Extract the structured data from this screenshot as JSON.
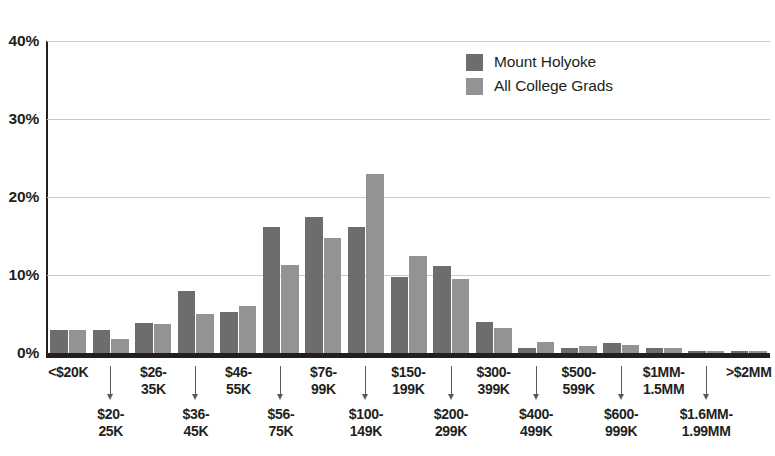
{
  "chart_data": {
    "type": "bar",
    "title": "",
    "subtitle": "",
    "xlabel": "",
    "ylabel": "",
    "ylim": [
      0,
      40
    ],
    "yticks": [
      0,
      10,
      20,
      30,
      40
    ],
    "ytick_labels": [
      "0%",
      "10%",
      "20%",
      "30%",
      "40%"
    ],
    "grid": true,
    "legend_position": "top-right",
    "categories": [
      "<$20K",
      "$20-\n25K",
      "$26-\n35K",
      "$36-\n45K",
      "$46-\n55K",
      "$56-\n75K",
      "$76-\n99K",
      "$100-\n149K",
      "$150-\n199K",
      "$200-\n299K",
      "$300-\n399K",
      "$400-\n499K",
      "$500-\n599K",
      "$600-\n999K",
      "$1MM-\n1.5MM",
      "$1.6MM-\n1.99MM",
      ">$2MM"
    ],
    "series": [
      {
        "name": "Mount Holyoke",
        "color": "#6d6d6d",
        "values": [
          3.0,
          3.0,
          3.9,
          7.9,
          5.2,
          16.1,
          17.4,
          16.1,
          9.8,
          11.1,
          4.0,
          0.7,
          0.7,
          1.3,
          0.7,
          0.2,
          0.2
        ]
      },
      {
        "name": "All College Grads",
        "color": "#939393",
        "values": [
          3.0,
          1.8,
          3.7,
          5.0,
          6.0,
          11.3,
          14.7,
          23.0,
          12.4,
          9.5,
          3.2,
          1.4,
          0.9,
          1.0,
          0.6,
          0.2,
          0.3
        ]
      }
    ]
  },
  "legend": {
    "items": [
      {
        "label": "Mount Holyoke",
        "color": "#6d6d6d"
      },
      {
        "label": "All College Grads",
        "color": "#939393"
      }
    ]
  },
  "axis": {
    "y_tick_labels": [
      "40%",
      "30%",
      "20%",
      "10%",
      "0%"
    ]
  },
  "x_axis_rows": {
    "top": [
      "<$20K",
      "$26-\n35K",
      "$46-\n55K",
      "$76-\n99K",
      "$150-\n199K",
      "$300-\n399K",
      "$500-\n599K",
      "$1MM-\n1.5MM",
      ">$2MM"
    ],
    "bottom": [
      "$20-\n25K",
      "$36-\n45K",
      "$56-\n75K",
      "$100-\n149K",
      "$200-\n299K",
      "$400-\n499K",
      "$600-\n999K",
      "$1.6MM-\n1.99MM"
    ]
  }
}
